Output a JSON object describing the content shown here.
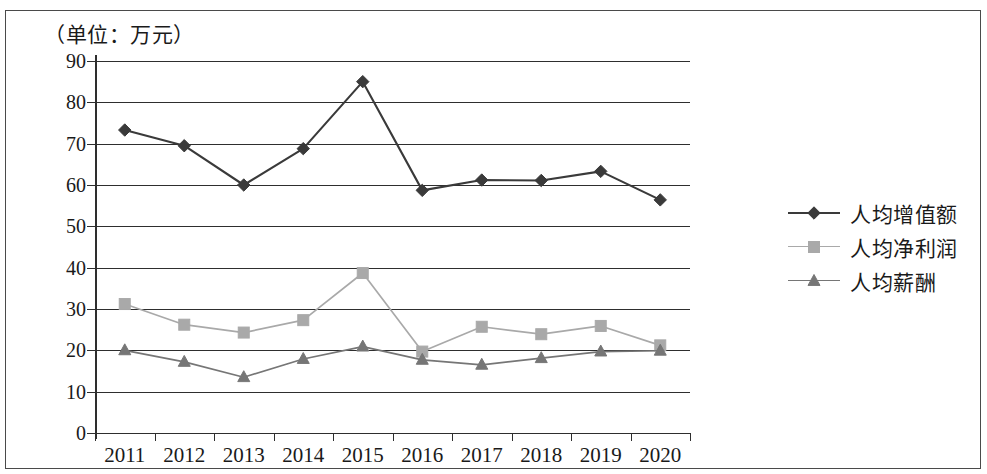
{
  "caption": "（单位：万元）",
  "legend": {
    "position": "right",
    "items": [
      {
        "label": "人均增值额",
        "marker": "diamond-marker-icon",
        "color": "#3a3a3a"
      },
      {
        "label": "人均净利润",
        "marker": "square-marker-icon",
        "color": "#a9a9a9"
      },
      {
        "label": "人均薪酬",
        "marker": "triangle-marker-icon",
        "color": "#767676"
      }
    ]
  },
  "chart_data": {
    "type": "line",
    "title": "",
    "subtitle": "",
    "xlabel": "",
    "ylabel": "",
    "unit_note": "（单位：万元）",
    "categories": [
      "2011",
      "2012",
      "2013",
      "2014",
      "2015",
      "2016",
      "2017",
      "2018",
      "2019",
      "2020"
    ],
    "x_tick_labels": [
      "2011",
      "2012",
      "2013",
      "2014",
      "2015",
      "2016",
      "2017",
      "2018",
      "2019",
      "2020"
    ],
    "y_tick_labels": [
      "0",
      "10",
      "20",
      "30",
      "40",
      "50",
      "60",
      "70",
      "80",
      "90"
    ],
    "yticks": [
      0,
      10,
      20,
      30,
      40,
      50,
      60,
      70,
      80,
      90
    ],
    "ylim": [
      0,
      90
    ],
    "grid": "horizontal",
    "legend_position": "right",
    "series": [
      {
        "name": "人均增值额",
        "marker": "diamond",
        "color": "#3a3a3a",
        "values": [
          73.3,
          69.5,
          60.0,
          68.8,
          85.0,
          58.7,
          61.2,
          61.1,
          63.3,
          56.4
        ]
      },
      {
        "name": "人均净利润",
        "marker": "square",
        "color": "#a9a9a9",
        "values": [
          31.2,
          26.2,
          24.3,
          27.3,
          38.7,
          19.7,
          25.7,
          23.9,
          25.9,
          21.2
        ]
      },
      {
        "name": "人均薪酬",
        "marker": "triangle",
        "color": "#767676",
        "values": [
          20.0,
          17.2,
          13.5,
          17.9,
          20.9,
          17.7,
          16.5,
          18.1,
          19.7,
          19.9
        ]
      }
    ]
  }
}
